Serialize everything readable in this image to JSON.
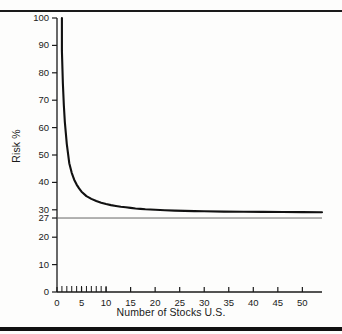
{
  "figure": {
    "background_color": "#fdfdfc",
    "axis_color": "#1a1a1a",
    "curve_color": "#111111",
    "reference_line_color": "#555555",
    "rule_top": "rule-top",
    "rule_bottom": "rule-bottom"
  },
  "chart_data": {
    "type": "line",
    "title": "",
    "xlabel": "Number of Stocks U.S.",
    "ylabel": "Risk %",
    "xlim": [
      0,
      54
    ],
    "ylim": [
      0,
      100
    ],
    "grid": false,
    "legend": null,
    "y_ticks": [
      0,
      10,
      20,
      27,
      30,
      40,
      50,
      60,
      70,
      80,
      90,
      100
    ],
    "y_tick_labels": [
      "0",
      "10",
      "20",
      "27",
      "30",
      "40",
      "50",
      "60",
      "70",
      "80",
      "90",
      "100"
    ],
    "x_ticks": [
      0,
      5,
      10,
      15,
      20,
      25,
      30,
      35,
      40,
      45,
      50
    ],
    "x_tick_labels": [
      "0",
      "5",
      "10",
      "15",
      "20",
      "25",
      "30",
      "35",
      "40",
      "45",
      "50"
    ],
    "x_minor_ticks": [
      1,
      2,
      3,
      4,
      5,
      6,
      7,
      8,
      9,
      10
    ],
    "annotations": [
      {
        "name": "systematic-risk-line",
        "type": "hline",
        "y": 27,
        "label": "27"
      }
    ],
    "series": [
      {
        "name": "Portfolio Risk",
        "x": [
          1,
          1,
          1.2,
          1.4,
          1.6,
          1.8,
          2,
          2.5,
          3,
          3.5,
          4,
          4.5,
          5,
          6,
          7,
          8,
          9,
          10,
          11,
          12,
          13,
          14,
          15,
          16,
          17,
          18,
          19,
          20,
          22,
          24,
          26,
          28,
          30,
          34,
          38,
          42,
          46,
          50,
          54
        ],
        "y": [
          100,
          88,
          76,
          68,
          62,
          58,
          54,
          47,
          43.5,
          41,
          39.2,
          37.8,
          36.6,
          35,
          34,
          33.2,
          32.6,
          32.1,
          31.7,
          31.4,
          31.1,
          30.9,
          30.7,
          30.5,
          30.35,
          30.2,
          30.1,
          30,
          29.85,
          29.7,
          29.6,
          29.5,
          29.45,
          29.35,
          29.3,
          29.25,
          29.2,
          29.15,
          29.1
        ]
      }
    ]
  }
}
